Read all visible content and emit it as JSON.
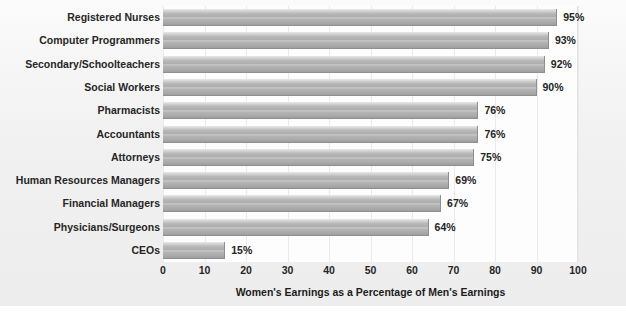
{
  "chart_data": {
    "type": "bar",
    "orientation": "horizontal",
    "title": "",
    "xlabel": "Women's Earnings as a Percentage of Men's Earnings",
    "ylabel": "",
    "xlim": [
      0,
      100
    ],
    "xticks": [
      "0",
      "10",
      "20",
      "30",
      "40",
      "50",
      "60",
      "70",
      "80",
      "90",
      "100"
    ],
    "grid": true,
    "legend": false,
    "value_suffix": "%",
    "categories": [
      "Registered Nurses",
      "Computer Programmers",
      "Secondary/Schoolteachers",
      "Social Workers",
      "Pharmacists",
      "Accountants",
      "Attorneys",
      "Human Resources Managers",
      "Financial Managers",
      "Physicians/Surgeons",
      "CEOs"
    ],
    "values": [
      95,
      93,
      92,
      90,
      76,
      76,
      75,
      69,
      67,
      64,
      15
    ],
    "value_labels": [
      "95%",
      "93%",
      "92%",
      "90%",
      "76%",
      "76%",
      "75%",
      "69%",
      "67%",
      "64%",
      "15%"
    ],
    "colors": {
      "bar_light": "#e9e9e9",
      "bar_mid": "#b4b4b4",
      "bar_dark": "#9e9e9e",
      "bar_edge": "#8f8f8f",
      "plot_background": "#fdfdfd",
      "figure_background": "#f1f1f1",
      "text": "#262626",
      "gridline": "#eaeaea"
    }
  }
}
